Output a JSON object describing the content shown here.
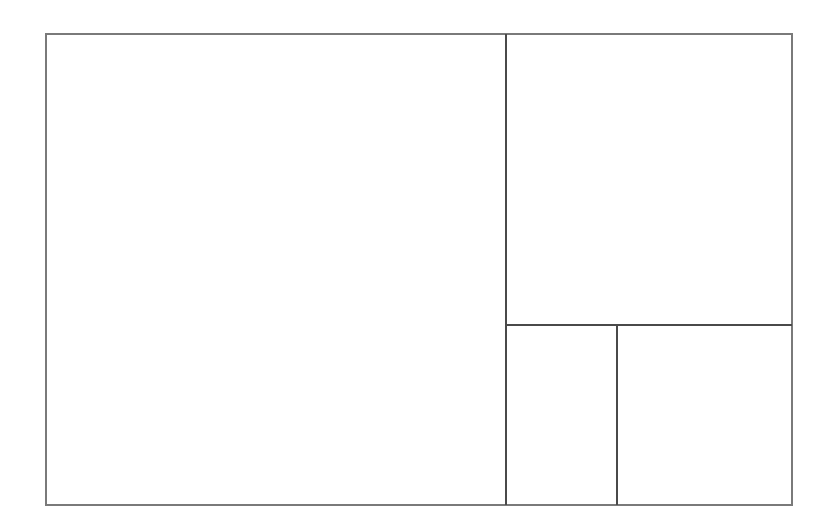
{
  "diagram": {
    "type": "rectangle-subdivision",
    "colors": {
      "background": "#ffffff",
      "outer_border": "#7a7a7a",
      "divider": "#4a4a4a"
    },
    "regions": [
      {
        "name": "large-left-square"
      },
      {
        "name": "top-right-rect"
      },
      {
        "name": "bottom-middle-rect"
      },
      {
        "name": "bottom-right-rect"
      }
    ]
  }
}
